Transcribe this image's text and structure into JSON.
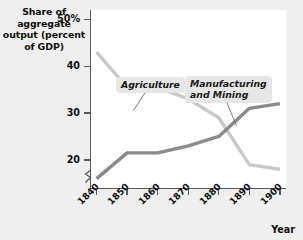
{
  "chart_data": {
    "type": "line",
    "title": "",
    "xlabel": "Year",
    "ylabel": "Share of aggregate output (percent of GDP)",
    "x": [
      1840,
      1850,
      1860,
      1870,
      1880,
      1890,
      1900
    ],
    "xlim": [
      1838,
      1902
    ],
    "ylim": [
      14,
      52
    ],
    "grid": false,
    "legend_position": "inline-callout",
    "axis_break_y": true,
    "series": [
      {
        "name": "Agriculture",
        "color": "#c9c9c9",
        "values": [
          43,
          35.5,
          35.5,
          33,
          29,
          19,
          18
        ]
      },
      {
        "name": "Manufacturing and Mining",
        "color": "#8a8a8a",
        "values": [
          16,
          21.5,
          21.5,
          23,
          25,
          31,
          32
        ]
      }
    ],
    "ytick_labels": [
      "50%",
      "40",
      "30",
      "20"
    ],
    "ytick_values": [
      50,
      40,
      30,
      20
    ],
    "xtick_labels": [
      "1840",
      "1850",
      "1860",
      "1870",
      "1880",
      "1890",
      "1900"
    ]
  },
  "axes": {
    "y_title": "Share of\naggregate\noutput (percent\nof GDP)",
    "x_title": "Year"
  },
  "callouts": {
    "agriculture": "Agriculture",
    "manufacturing": "Manufacturing\nand Mining"
  },
  "colors": {
    "agriculture_line": "#c9c9c9",
    "manufacturing_line": "#8a8a8a",
    "axis": "#59595b",
    "plot_background": "#ffffff",
    "page_background": "#efefef",
    "callout_background": "#e6e6e6",
    "text": "#121212"
  }
}
